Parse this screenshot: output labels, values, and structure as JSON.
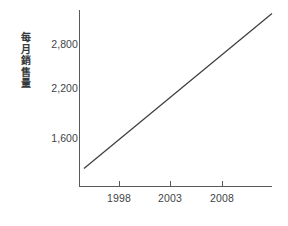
{
  "chart_data": {
    "type": "line",
    "title": "",
    "subtitle": "",
    "ylabel": "每月銷售量",
    "ylabel_chars": [
      "每",
      "月",
      "銷",
      "售",
      "量"
    ],
    "xlabel": "",
    "grid": false,
    "legend": false,
    "legend_position": "none",
    "xlim": [
      1995.6,
      2012.9
    ],
    "ylim": [
      1180,
      3230
    ],
    "xticks": [
      1998,
      2003,
      2008
    ],
    "xtick_labels": [
      "1998",
      "2003",
      "2008"
    ],
    "yticks": [
      1600,
      2200,
      2800
    ],
    "ytick_labels": [
      "1,600",
      "2,200",
      "2,800"
    ],
    "series": [
      {
        "name": "每月銷售量",
        "color": "#3a3f42",
        "x": [
          1996.0,
          2012.9
        ],
        "values": [
          1390,
          3190
        ]
      }
    ],
    "annotations": []
  },
  "colors": {
    "background": "#ffffff",
    "axis": "#555a5c",
    "text": "#3f4446",
    "series": "#3a3f42"
  }
}
